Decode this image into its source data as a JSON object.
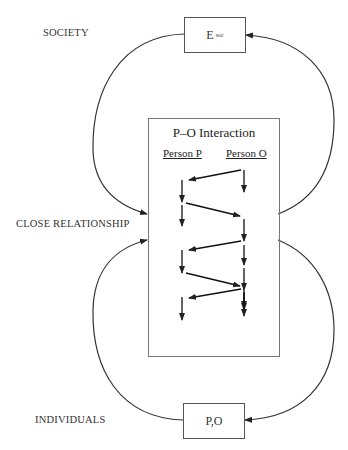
{
  "levels": {
    "society": "SOCIETY",
    "close_relationship": "CLOSE RELATIONSHIP",
    "individuals": "INDIVIDUALS"
  },
  "nodes": {
    "environment": {
      "main": "E",
      "sub": "soc"
    },
    "persons": {
      "label": "P,O"
    }
  },
  "interaction": {
    "title": "P–O Interaction",
    "col_p": "Person P",
    "col_o": "Person O"
  },
  "colors": {
    "line": "#222222",
    "box_border": "#555555"
  }
}
